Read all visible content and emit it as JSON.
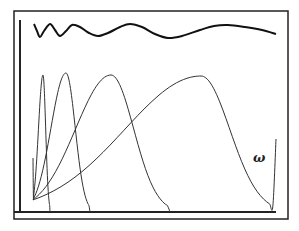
{
  "figure": {
    "label": "ω",
    "frame": {
      "x": 14,
      "y": 11,
      "width": 274,
      "height": 208,
      "color": "#222222"
    },
    "axes": {
      "y_axis": {
        "x": 20,
        "y1": 20,
        "y2": 212
      },
      "x_axis": {
        "y": 212,
        "x1": 14,
        "x2": 276
      }
    },
    "top_signal": {
      "description": "oscillating waveform with decreasing frequency",
      "stroke": "#111111",
      "stroke_width": 2,
      "points": [
        [
          34,
          24
        ],
        [
          37,
          31
        ],
        [
          40,
          37
        ],
        [
          44,
          31
        ],
        [
          50,
          24
        ],
        [
          55,
          30
        ],
        [
          60,
          36
        ],
        [
          66,
          31
        ],
        [
          72,
          25
        ],
        [
          80,
          27
        ],
        [
          89,
          33
        ],
        [
          98,
          36
        ],
        [
          108,
          33
        ],
        [
          120,
          27
        ],
        [
          130,
          24
        ],
        [
          142,
          27
        ],
        [
          155,
          34
        ],
        [
          168,
          38
        ],
        [
          182,
          36
        ],
        [
          200,
          30
        ],
        [
          214,
          26
        ],
        [
          228,
          25
        ],
        [
          245,
          27
        ],
        [
          262,
          30
        ],
        [
          276,
          34
        ]
      ]
    },
    "bumps": [
      {
        "name": "band-1",
        "left": [
          33,
          158
        ],
        "peak": [
          43,
          75
        ],
        "right": [
          50,
          212
        ]
      },
      {
        "name": "band-2",
        "left": [
          33,
          205
        ],
        "peak": [
          66,
          73
        ],
        "right": [
          90,
          212
        ]
      },
      {
        "name": "band-3",
        "left": [
          33,
          210
        ],
        "peak": [
          111,
          75
        ],
        "right": [
          170,
          212
        ]
      },
      {
        "name": "band-4",
        "left": [
          33,
          212
        ],
        "peak": [
          201,
          76
        ],
        "right": [
          276,
          139
        ]
      }
    ],
    "bump_stroke": "#333333"
  }
}
